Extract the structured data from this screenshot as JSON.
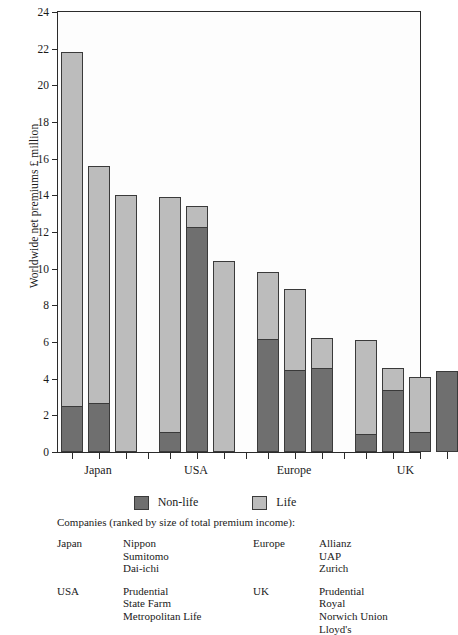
{
  "axis": {
    "ylabel": "Worldwide net premiums £ million",
    "yticks": [
      0,
      2,
      4,
      6,
      8,
      10,
      12,
      14,
      16,
      18,
      20,
      22,
      24
    ],
    "ymin": 0,
    "ymax": 24
  },
  "legend": {
    "items": [
      {
        "label": "Non-life",
        "color": "#6f6f6f",
        "key": "nonlife"
      },
      {
        "label": "Life",
        "color": "#bcbcbc",
        "key": "life"
      }
    ]
  },
  "caption": {
    "line": "Companies (ranked by size of total premium income):",
    "columns": [
      {
        "blocks": [
          {
            "region": "Japan",
            "companies": [
              "Nippon",
              "Sumitomo",
              "Dai-ichi"
            ]
          },
          {
            "region": "USA",
            "companies": [
              "Prudential",
              "State Farm",
              "Metropolitan Life"
            ]
          }
        ]
      },
      {
        "blocks": [
          {
            "region": "Europe",
            "companies": [
              "Allianz",
              "UAP",
              "Zurich"
            ]
          },
          {
            "region": "UK",
            "companies": [
              "Prudential",
              "Royal",
              "Norwich Union",
              "Lloyd's"
            ]
          }
        ]
      }
    ]
  },
  "chart_data": {
    "type": "bar",
    "subtype": "stacked",
    "title": "",
    "xlabel": "",
    "ylabel": "Worldwide net premiums £ million",
    "ylim": [
      0,
      24
    ],
    "ytick_step": 2,
    "grid": false,
    "legend_position": "below-axes",
    "categories": [
      "Japan",
      "USA",
      "Europe",
      "UK"
    ],
    "series": [
      {
        "name": "Non-life",
        "color": "#6f6f6f"
      },
      {
        "name": "Life",
        "color": "#bcbcbc"
      }
    ],
    "groups": [
      {
        "category": "Japan",
        "company_labels": [
          "Nippon",
          "Sumitomo",
          "Dai-ichi"
        ],
        "bars": [
          {
            "company": "Nippon",
            "nonlife": 2.5,
            "life": 19.3,
            "total": 21.8
          },
          {
            "company": "Sumitomo",
            "nonlife": 2.7,
            "life": 12.9,
            "total": 15.6
          },
          {
            "company": "Dai-ichi",
            "nonlife": 0.0,
            "life": 14.0,
            "total": 14.0
          }
        ]
      },
      {
        "category": "USA",
        "company_labels": [
          "Prudential",
          "State Farm",
          "Metropolitan Life"
        ],
        "bars": [
          {
            "company": "Prudential",
            "nonlife": 1.1,
            "life": 12.8,
            "total": 13.9
          },
          {
            "company": "State Farm",
            "nonlife": 12.3,
            "life": 1.1,
            "total": 13.4
          },
          {
            "company": "Metropolitan Life",
            "nonlife": 0.0,
            "life": 10.4,
            "total": 10.4
          }
        ]
      },
      {
        "category": "Europe",
        "company_labels": [
          "Allianz",
          "UAP",
          "Zurich"
        ],
        "bars": [
          {
            "company": "Allianz",
            "nonlife": 6.2,
            "life": 3.6,
            "total": 9.8
          },
          {
            "company": "UAP",
            "nonlife": 4.5,
            "life": 4.4,
            "total": 8.9
          },
          {
            "company": "Zurich",
            "nonlife": 4.6,
            "life": 1.6,
            "total": 6.2
          }
        ]
      },
      {
        "category": "UK",
        "company_labels": [
          "Prudential",
          "Royal",
          "Norwich Union",
          "Lloyd's"
        ],
        "bars": [
          {
            "company": "Prudential",
            "nonlife": 1.0,
            "life": 5.1,
            "total": 6.1
          },
          {
            "company": "Royal",
            "nonlife": 3.4,
            "life": 1.2,
            "total": 4.6
          },
          {
            "company": "Norwich Union",
            "nonlife": 1.1,
            "life": 3.0,
            "total": 4.1
          },
          {
            "company": "Lloyd's",
            "nonlife": 4.4,
            "life": 0.0,
            "total": 4.4
          }
        ]
      }
    ]
  },
  "layout": {
    "bar_width_px": 22,
    "bar_gap_px": 5,
    "group_gap_px": 22,
    "first_bar_left_px": 3
  }
}
